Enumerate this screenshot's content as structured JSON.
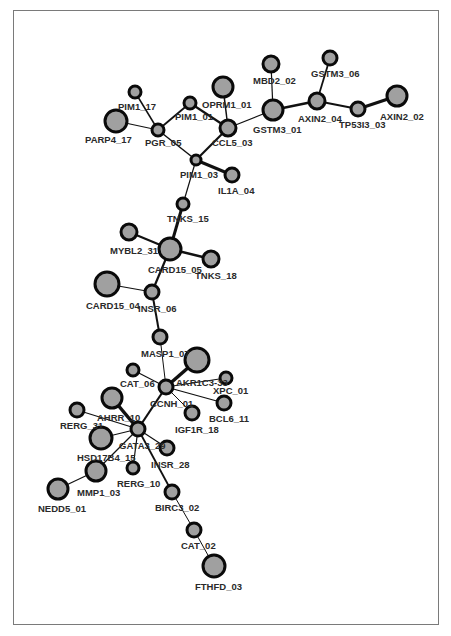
{
  "diagram": {
    "type": "network-graph",
    "colors": {
      "node_fill": "#a0a0a0",
      "node_stroke": "#0a0a0a",
      "edge": "#111111",
      "frame": "#7a7a7a",
      "label": "#2a2a2a"
    },
    "nodes": [
      {
        "id": "PIM1_17",
        "label": "PIM1_17",
        "x": 135,
        "y": 92,
        "r": 6,
        "lx": 118,
        "ly": 110
      },
      {
        "id": "PARP4_17",
        "label": "PARP4_17",
        "x": 116,
        "y": 121,
        "r": 11,
        "lx": 85,
        "ly": 143
      },
      {
        "id": "PGR_05",
        "label": "PGR_05",
        "x": 158,
        "y": 130,
        "r": 6,
        "lx": 145,
        "ly": 146
      },
      {
        "id": "PIM1_01",
        "label": "PIM1_01",
        "x": 190,
        "y": 103,
        "r": 6,
        "lx": 175,
        "ly": 120
      },
      {
        "id": "OPRM1_01",
        "label": "OPRM1_01",
        "x": 223,
        "y": 87,
        "r": 10,
        "lx": 202,
        "ly": 108
      },
      {
        "id": "CCL5_03",
        "label": "CCL5_03",
        "x": 228,
        "y": 128,
        "r": 8,
        "lx": 212,
        "ly": 146
      },
      {
        "id": "MBD2_02",
        "label": "MBD2_02",
        "x": 271,
        "y": 64,
        "r": 8,
        "lx": 253,
        "ly": 84
      },
      {
        "id": "GSTM3_01",
        "label": "GSTM3_01",
        "x": 273,
        "y": 110,
        "r": 10,
        "lx": 253,
        "ly": 133
      },
      {
        "id": "GSTM3_06",
        "label": "GSTM3_06",
        "x": 330,
        "y": 58,
        "r": 7,
        "lx": 311,
        "ly": 77
      },
      {
        "id": "AXIN2_04",
        "label": "AXIN2_04",
        "x": 317,
        "y": 101,
        "r": 8,
        "lx": 298,
        "ly": 122
      },
      {
        "id": "TP53I3_03",
        "label": "TP53I3_03",
        "x": 358,
        "y": 109,
        "r": 7,
        "lx": 339,
        "ly": 128
      },
      {
        "id": "AXIN2_02",
        "label": "AXIN2_02",
        "x": 397,
        "y": 96,
        "r": 10,
        "lx": 380,
        "ly": 120
      },
      {
        "id": "PIM1_03",
        "label": "PIM1_03",
        "x": 196,
        "y": 160,
        "r": 5,
        "lx": 180,
        "ly": 178
      },
      {
        "id": "IL1A_04",
        "label": "IL1A_04",
        "x": 232,
        "y": 175,
        "r": 7,
        "lx": 218,
        "ly": 194
      },
      {
        "id": "TNKS_15",
        "label": "TNKS_15",
        "x": 183,
        "y": 204,
        "r": 6,
        "lx": 167,
        "ly": 222
      },
      {
        "id": "MYBL2_31",
        "label": "MYBL2_31",
        "x": 129,
        "y": 232,
        "r": 8,
        "lx": 110,
        "ly": 254
      },
      {
        "id": "CARD15_05",
        "label": "CARD15_05",
        "x": 170,
        "y": 249,
        "r": 11,
        "lx": 148,
        "ly": 273
      },
      {
        "id": "TNKS_18",
        "label": "TNKS_18",
        "x": 211,
        "y": 259,
        "r": 8,
        "lx": 195,
        "ly": 279
      },
      {
        "id": "CARD15_04",
        "label": "CARD15_04",
        "x": 107,
        "y": 284,
        "r": 12,
        "lx": 86,
        "ly": 309
      },
      {
        "id": "INSR_06",
        "label": "INSR_06",
        "x": 152,
        "y": 292,
        "r": 7,
        "lx": 138,
        "ly": 312
      },
      {
        "id": "MASP1_07",
        "label": "MASP1_07",
        "x": 160,
        "y": 337,
        "r": 7,
        "lx": 141,
        "ly": 357
      },
      {
        "id": "AKR1C3_33",
        "label": "AKR1C3-33",
        "x": 197,
        "y": 360,
        "r": 12,
        "lx": 176,
        "ly": 386
      },
      {
        "id": "CAT_06",
        "label": "CAT_06",
        "x": 133,
        "y": 370,
        "r": 6,
        "lx": 120,
        "ly": 387
      },
      {
        "id": "XPC_01",
        "label": "XPC_01",
        "x": 226,
        "y": 378,
        "r": 6,
        "lx": 213,
        "ly": 394
      },
      {
        "id": "CCNH_01",
        "label": "CCNH_01",
        "x": 166,
        "y": 387,
        "r": 7,
        "lx": 150,
        "ly": 407
      },
      {
        "id": "BCL6_11",
        "label": "BCL6_11",
        "x": 224,
        "y": 403,
        "r": 7,
        "lx": 209,
        "ly": 422
      },
      {
        "id": "AHRR_10",
        "label": "AHRR_10",
        "x": 112,
        "y": 398,
        "r": 10,
        "lx": 97,
        "ly": 421
      },
      {
        "id": "RERG_31",
        "label": "RERG_31",
        "x": 77,
        "y": 410,
        "r": 7,
        "lx": 60,
        "ly": 429
      },
      {
        "id": "IGF1R_18",
        "label": "IGF1R_18",
        "x": 192,
        "y": 413,
        "r": 7,
        "lx": 175,
        "ly": 433
      },
      {
        "id": "GATA3_29",
        "label": "GATA3_29",
        "x": 138,
        "y": 429,
        "r": 7,
        "lx": 119,
        "ly": 449
      },
      {
        "id": "HSD17B4_15",
        "label": "HSD17B4_15",
        "x": 101,
        "y": 438,
        "r": 11,
        "lx": 77,
        "ly": 461
      },
      {
        "id": "INSR_28",
        "label": "INSR_28",
        "x": 167,
        "y": 448,
        "r": 7,
        "lx": 151,
        "ly": 468
      },
      {
        "id": "MMP1_03",
        "label": "MMP1_03",
        "x": 96,
        "y": 471,
        "r": 10,
        "lx": 77,
        "ly": 496
      },
      {
        "id": "RERG_10",
        "label": "RERG_10",
        "x": 133,
        "y": 468,
        "r": 6,
        "lx": 117,
        "ly": 487
      },
      {
        "id": "NEDD5_01",
        "label": "NEDD5_01",
        "x": 58,
        "y": 489,
        "r": 10,
        "lx": 38,
        "ly": 512
      },
      {
        "id": "BIRC3_02",
        "label": "BIRC3_02",
        "x": 172,
        "y": 492,
        "r": 7,
        "lx": 155,
        "ly": 511
      },
      {
        "id": "CAT_02",
        "label": "CAT_02",
        "x": 194,
        "y": 530,
        "r": 7,
        "lx": 181,
        "ly": 549
      },
      {
        "id": "FTHFD_03",
        "label": "FTHFD_03",
        "x": 214,
        "y": 566,
        "r": 11,
        "lx": 195,
        "ly": 590
      }
    ],
    "edges": [
      {
        "from": "PIM1_17",
        "to": "PGR_05",
        "w": 1.5
      },
      {
        "from": "PARP4_17",
        "to": "PGR_05",
        "w": 1.2
      },
      {
        "from": "PGR_05",
        "to": "PIM1_01",
        "w": 1.8
      },
      {
        "from": "PIM1_01",
        "to": "CCL5_03",
        "w": 2.2
      },
      {
        "from": "OPRM1_01",
        "to": "CCL5_03",
        "w": 1.5
      },
      {
        "from": "PGR_05",
        "to": "PIM1_03",
        "w": 1.5
      },
      {
        "from": "CCL5_03",
        "to": "PIM1_03",
        "w": 2.2
      },
      {
        "from": "CCL5_03",
        "to": "GSTM3_01",
        "w": 1.2
      },
      {
        "from": "MBD2_02",
        "to": "GSTM3_01",
        "w": 1.2
      },
      {
        "from": "GSTM3_01",
        "to": "AXIN2_04",
        "w": 2.5
      },
      {
        "from": "GSTM3_06",
        "to": "AXIN2_04",
        "w": 1.8
      },
      {
        "from": "AXIN2_04",
        "to": "TP53I3_03",
        "w": 2.2
      },
      {
        "from": "TP53I3_03",
        "to": "AXIN2_02",
        "w": 3
      },
      {
        "from": "PIM1_03",
        "to": "IL1A_04",
        "w": 3
      },
      {
        "from": "PIM1_03",
        "to": "TNKS_15",
        "w": 1.2
      },
      {
        "from": "TNKS_15",
        "to": "CARD15_05",
        "w": 3
      },
      {
        "from": "MYBL2_31",
        "to": "CARD15_05",
        "w": 2.2
      },
      {
        "from": "CARD15_05",
        "to": "TNKS_18",
        "w": 2.5
      },
      {
        "from": "CARD15_05",
        "to": "INSR_06",
        "w": 2.2
      },
      {
        "from": "CARD15_04",
        "to": "INSR_06",
        "w": 1.2
      },
      {
        "from": "INSR_06",
        "to": "MASP1_07",
        "w": 2
      },
      {
        "from": "MASP1_07",
        "to": "CCNH_01",
        "w": 1
      },
      {
        "from": "AKR1C3_33",
        "to": "CCNH_01",
        "w": 3.5
      },
      {
        "from": "CAT_06",
        "to": "CCNH_01",
        "w": 1.2
      },
      {
        "from": "XPC_01",
        "to": "CCNH_01",
        "w": 1
      },
      {
        "from": "BCL6_11",
        "to": "CCNH_01",
        "w": 1.2
      },
      {
        "from": "IGF1R_18",
        "to": "CCNH_01",
        "w": 1
      },
      {
        "from": "CCNH_01",
        "to": "GATA3_29",
        "w": 2.2
      },
      {
        "from": "AHRR_10",
        "to": "GATA3_29",
        "w": 3.5
      },
      {
        "from": "RERG_31",
        "to": "GATA3_29",
        "w": 1.2
      },
      {
        "from": "HSD17B4_15",
        "to": "GATA3_29",
        "w": 1.2
      },
      {
        "from": "GATA3_29",
        "to": "INSR_28",
        "w": 1.2
      },
      {
        "from": "GATA3_29",
        "to": "RERG_10",
        "w": 1.2
      },
      {
        "from": "GATA3_29",
        "to": "MMP1_03",
        "w": 1.2
      },
      {
        "from": "MMP1_03",
        "to": "NEDD5_01",
        "w": 1.2
      },
      {
        "from": "GATA3_29",
        "to": "BIRC3_02",
        "w": 1.8
      },
      {
        "from": "BIRC3_02",
        "to": "CAT_02",
        "w": 1
      },
      {
        "from": "CAT_02",
        "to": "FTHFD_03",
        "w": 1
      }
    ]
  }
}
